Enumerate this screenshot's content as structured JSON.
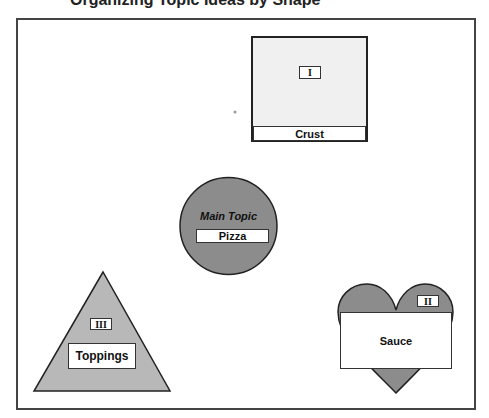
{
  "header": {
    "title_partial": "Organizing Topic Ideas by Shape"
  },
  "diagram": {
    "colors": {
      "frame_border": "#444444",
      "square_fill": "#f0f0f0",
      "circle_fill": "#8c8c8c",
      "triangle_fill": "#b8b8b8",
      "heart_fill": "#8c8c8c",
      "outline": "#222222"
    },
    "main_topic": {
      "shape": "circle",
      "caption": "Main Topic",
      "label": "Pizza"
    },
    "subtopics": [
      {
        "shape": "square",
        "numeral": "I",
        "label": "Crust"
      },
      {
        "shape": "heart",
        "numeral": "II",
        "label": "Sauce"
      },
      {
        "shape": "triangle",
        "numeral": "III",
        "label": "Toppings"
      }
    ]
  }
}
